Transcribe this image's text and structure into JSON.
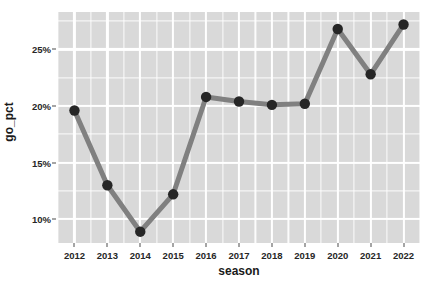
{
  "chart_data": {
    "type": "line",
    "title": "",
    "subtitle": "",
    "xlabel": "season",
    "ylabel": "go_pct",
    "x": [
      2012,
      2013,
      2014,
      2015,
      2016,
      2017,
      2018,
      2019,
      2020,
      2021,
      2022
    ],
    "categories": [
      "2012",
      "2013",
      "2014",
      "2015",
      "2016",
      "2017",
      "2018",
      "2019",
      "2020",
      "2021",
      "2022"
    ],
    "values": [
      19.6,
      13.0,
      8.9,
      12.2,
      20.8,
      20.4,
      20.1,
      20.2,
      26.8,
      22.8,
      27.2
    ],
    "series": [
      {
        "name": "go_pct",
        "values": [
          19.6,
          13.0,
          8.9,
          12.2,
          20.8,
          20.4,
          20.1,
          20.2,
          26.8,
          22.8,
          27.2
        ]
      }
    ],
    "xlim": [
      2011.5,
      2022.5
    ],
    "ylim": [
      7.9,
      28.3
    ],
    "y_ticks": [
      10,
      15,
      20,
      25
    ],
    "y_tick_labels": [
      "10%",
      "15%",
      "20%",
      "25%"
    ],
    "y_minor_ticks": [
      7.5,
      12.5,
      17.5,
      22.5,
      27.5
    ],
    "x_ticks": [
      2012,
      2013,
      2014,
      2015,
      2016,
      2017,
      2018,
      2019,
      2020,
      2021,
      2022
    ],
    "x_minor_ticks": [
      2011.5,
      2012.5,
      2013.5,
      2014.5,
      2015.5,
      2016.5,
      2017.5,
      2018.5,
      2019.5,
      2020.5,
      2021.5,
      2022.5
    ],
    "grid": true,
    "legend": false,
    "legend_position": "none",
    "annotations": [],
    "colors": {
      "panel_background": "#D9D9D9",
      "grid_line": "#FFFFFF",
      "line": "#808080",
      "point": "#262626",
      "axis_text": "#262626",
      "axis_title": "#1A1A1A",
      "figure_background": "#FFFFFF"
    },
    "style": {
      "line_width_px": 5,
      "point_radius_px": 5.2
    }
  }
}
